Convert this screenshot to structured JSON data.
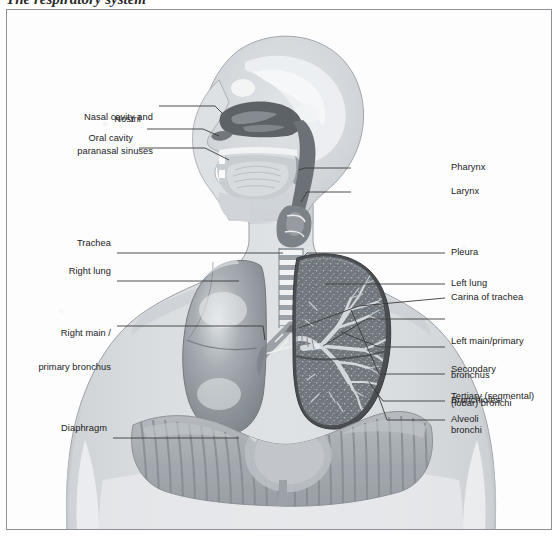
{
  "figure": {
    "title_partial": "The respiratory system",
    "type": "anatomical-diagram",
    "view": "anterior thorax with midsagittal head section",
    "colors": {
      "page_background": "#ffffff",
      "plate_background": "#fdfdfd",
      "plate_border": "#8d9196",
      "body_silhouette": "#d7dadd",
      "body_outline": "#9aa0a6",
      "lung_intact": "#8e9499",
      "lung_highlight": "#d9dde0",
      "pleura_dark": "#4a4e52",
      "lung_interior": "#6f767c",
      "bronchial_tree": "#d3d8dc",
      "airway_dark": "#6b7177",
      "nasal_cavity_dark": "#5d6267",
      "cartilage_light": "#eef0f2",
      "diaphragm": "#a9aeb3",
      "leader_line": "#3a3a3a",
      "label_text": "#1b1b1b"
    }
  },
  "labels": {
    "left": [
      {
        "id": "nasal-cavity-and-paranasal-sinuses",
        "lines": [
          "Nasal cavity and",
          "paranasal sinuses"
        ]
      },
      {
        "id": "nostril",
        "lines": [
          "Nostril"
        ]
      },
      {
        "id": "oral-cavity",
        "lines": [
          "Oral cavity"
        ]
      },
      {
        "id": "trachea",
        "lines": [
          "Trachea"
        ]
      },
      {
        "id": "right-lung",
        "lines": [
          "Right lung"
        ]
      },
      {
        "id": "right-main-primary-bronchus",
        "lines": [
          "Right main /",
          "primary bronchus"
        ]
      },
      {
        "id": "diaphragm",
        "lines": [
          "Diaphragm"
        ]
      }
    ],
    "right": [
      {
        "id": "pharynx",
        "lines": [
          "Pharynx"
        ]
      },
      {
        "id": "larynx",
        "lines": [
          "Larynx"
        ]
      },
      {
        "id": "pleura",
        "lines": [
          "Pleura"
        ]
      },
      {
        "id": "left-lung",
        "lines": [
          "Left lung"
        ]
      },
      {
        "id": "carina-of-trachea",
        "lines": [
          "Carina of trachea"
        ]
      },
      {
        "id": "left-main-primary-bronchus",
        "lines": [
          "Left main/primary",
          "bronchus"
        ]
      },
      {
        "id": "secondary-lobar-bronchi",
        "lines": [
          "Secondary",
          "(lobar) bronchi"
        ]
      },
      {
        "id": "tertiary-segmental-bronchi",
        "lines": [
          "Tertiary (segmental)",
          "bronchi"
        ]
      },
      {
        "id": "bronchioles",
        "lines": [
          "Bronchioles"
        ]
      },
      {
        "id": "alveoli",
        "lines": [
          "Alveoli"
        ]
      }
    ]
  },
  "label_text": {
    "nasal_cavity_l1": "Nasal cavity and",
    "nasal_cavity_l2": "paranasal sinuses",
    "nostril": "Nostril",
    "oral_cavity": "Oral cavity",
    "trachea": "Trachea",
    "right_lung": "Right lung",
    "right_bronchus_l1": "Right main /",
    "right_bronchus_l2": "primary bronchus",
    "diaphragm": "Diaphragm",
    "pharynx": "Pharynx",
    "larynx": "Larynx",
    "pleura": "Pleura",
    "left_lung": "Left lung",
    "carina": "Carina of trachea",
    "left_bronchus_l1": "Left main/primary",
    "left_bronchus_l2": "bronchus",
    "secondary_l1": "Secondary",
    "secondary_l2": "(lobar) bronchi",
    "tertiary_l1": "Tertiary (segmental)",
    "tertiary_l2": "bronchi",
    "bronchioles": "Bronchioles",
    "alveoli": "Alveoli"
  }
}
